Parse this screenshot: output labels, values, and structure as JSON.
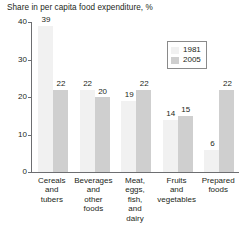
{
  "chart_data": {
    "type": "bar",
    "title": "Share in per capita food expenditure, %",
    "xlabel": "",
    "ylabel": "",
    "ylim": [
      0,
      40
    ],
    "yticks": [
      0,
      10,
      20,
      30,
      40
    ],
    "ytick_labels": [
      "0",
      "10",
      "20",
      "30",
      "40"
    ],
    "grid": false,
    "legend_position": "top-right",
    "categories": [
      "Cereals and tubers",
      "Beverages and other foods",
      "Meat, eggs, fish, and dairy",
      "Fruits and vegetables",
      "Prepared foods"
    ],
    "category_lines": [
      [
        "Cereals",
        "and",
        "tubers"
      ],
      [
        "Beverages",
        "and",
        "other",
        "foods"
      ],
      [
        "Meat,",
        "eggs,",
        "fish,",
        "and",
        "dairy"
      ],
      [
        "Fruits",
        "and",
        "vegetables"
      ],
      [
        "Prepared",
        "foods"
      ]
    ],
    "series": [
      {
        "name": "1981",
        "color": "#f1f1f1",
        "values": [
          39,
          22,
          19,
          14,
          6
        ]
      },
      {
        "name": "2005",
        "color": "#cfcfcf",
        "values": [
          22,
          20,
          22,
          15,
          22
        ]
      }
    ]
  },
  "legend": {
    "entries": [
      {
        "label": "1981",
        "swatch": "#f1f1f1"
      },
      {
        "label": "2005",
        "swatch": "#cfcfcf"
      }
    ]
  },
  "axis_color": "#6d6e71",
  "text_color": "#231f20",
  "background": "#ffffff"
}
